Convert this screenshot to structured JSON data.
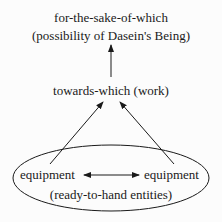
{
  "diagram": {
    "top_node": {
      "line1": "for-the-sake-of-which",
      "line2": "(possibility of Dasein's Being)"
    },
    "middle_node": {
      "label": "towards-which (work)"
    },
    "bottom_group": {
      "left": "equipment",
      "right": "equipment",
      "caption": "(ready-to-hand entities)"
    },
    "edges": [
      {
        "from": "towards-which (work)",
        "to": "for-the-sake-of-which",
        "type": "arrow"
      },
      {
        "from": "equipment (left)",
        "to": "towards-which (work)",
        "type": "arrow"
      },
      {
        "from": "equipment (right)",
        "to": "towards-which (work)",
        "type": "arrow"
      },
      {
        "from": "equipment (left)",
        "to": "equipment (right)",
        "type": "bidirectional-arrow"
      }
    ],
    "colors": {
      "ink": "#1a1a1a",
      "background": "#fcfcfc"
    }
  }
}
